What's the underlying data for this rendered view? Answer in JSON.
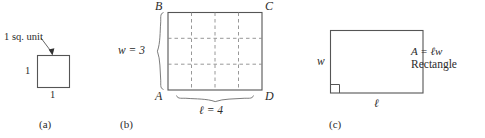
{
  "figure": {
    "type": "geometry-diagram",
    "topic": "Area of a rectangle",
    "panels": [
      {
        "id": "a",
        "caption": "(a)",
        "annotation": "1 sq. unit",
        "shape": "square",
        "side_left_label": "1",
        "side_bottom_label": "1",
        "pointer": "arrow"
      },
      {
        "id": "b",
        "caption": "(b)",
        "shape": "grid-rectangle",
        "columns": 4,
        "rows": 3,
        "vertex_top_left": "B",
        "vertex_top_right": "C",
        "vertex_bottom_left": "A",
        "vertex_bottom_right": "D",
        "width_label": "w  =  3",
        "length_label": "ℓ = 4"
      },
      {
        "id": "c",
        "caption": "(c)",
        "shape": "rectangle",
        "side_left_label": "w",
        "side_bottom_label": "ℓ",
        "formula": "A  =  ℓw",
        "formula_name": "Rectangle",
        "right_angle_marker": true
      }
    ],
    "colors": {
      "ink": "#2b2b2b",
      "stroke": "#555555",
      "dashed": "#8c8c8c",
      "brace": "#7d7d7d",
      "background": "#ffffff"
    }
  }
}
